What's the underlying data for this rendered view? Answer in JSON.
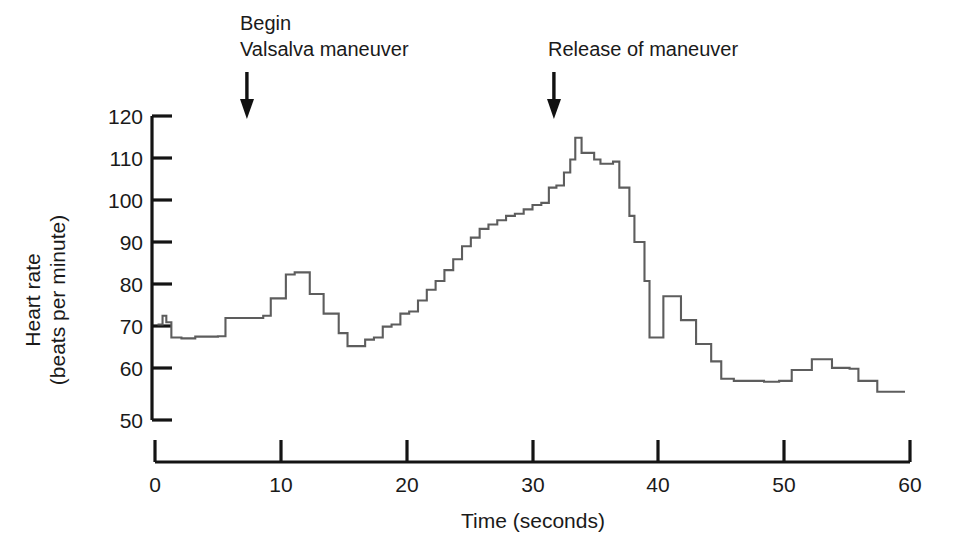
{
  "chart_data": {
    "type": "line",
    "title": "",
    "xlabel": "Time (seconds)",
    "ylabel": "Heart rate\n(beats per minute)",
    "ylabel_line1": "Heart rate",
    "ylabel_line2": "(beats per minute)",
    "xlim": [
      0,
      60
    ],
    "ylim": [
      50,
      120
    ],
    "xticks": [
      0,
      10,
      20,
      30,
      40,
      50,
      60
    ],
    "xtick_labels": [
      "0",
      "10",
      "20",
      "30",
      "40",
      "50",
      "60"
    ],
    "yticks": [
      50,
      60,
      70,
      80,
      90,
      100,
      110,
      120
    ],
    "ytick_labels": [
      "50",
      "60",
      "70",
      "80",
      "90",
      "100",
      "110",
      "120"
    ],
    "grid": false,
    "legend": null,
    "series": [
      {
        "name": "Heart rate",
        "color": "#5d5d5d",
        "style": "step",
        "x": [
          0.2,
          0.6,
          0.9,
          1.3,
          1.7,
          2.1,
          2.6,
          3.2,
          4.2,
          5.0,
          5.6,
          6.3,
          7.2,
          8.0,
          8.6,
          9.2,
          9.8,
          10.4,
          11.1,
          11.8,
          12.3,
          12.9,
          13.4,
          14.0,
          14.6,
          15.3,
          16.0,
          16.7,
          17.4,
          18.1,
          18.8,
          19.5,
          20.2,
          20.9,
          21.6,
          22.3,
          23.0,
          23.7,
          24.4,
          25.1,
          25.8,
          26.5,
          27.2,
          27.9,
          28.6,
          29.3,
          30.0,
          30.7,
          31.3,
          31.9,
          32.5,
          33.0,
          33.4,
          33.9,
          34.4,
          34.9,
          35.4,
          35.9,
          36.4,
          36.9,
          37.3,
          37.7,
          38.1,
          38.5,
          38.9,
          39.3,
          39.8,
          40.4,
          41.1,
          41.8,
          42.4,
          43.0,
          43.6,
          44.2,
          45.0,
          46.0,
          47.2,
          48.4,
          49.6,
          50.6,
          51.4,
          52.2,
          53.0,
          53.8,
          54.5,
          55.2,
          55.9,
          56.6,
          57.4,
          58.4,
          59.6
        ],
        "y": [
          72.0,
          74.0,
          72.5,
          69.0,
          69.0,
          68.8,
          68.8,
          69.2,
          69.2,
          69.3,
          73.5,
          73.5,
          73.5,
          73.5,
          74.0,
          78.0,
          78.0,
          83.5,
          84.0,
          84.0,
          79.0,
          79.0,
          74.5,
          74.5,
          70.0,
          67.0,
          67.0,
          68.5,
          69.0,
          71.5,
          72.0,
          74.5,
          75.0,
          77.5,
          80.0,
          82.0,
          84.5,
          87.0,
          90.0,
          92.0,
          94.0,
          95.0,
          96.0,
          97.0,
          97.5,
          98.5,
          99.5,
          100.0,
          103.5,
          104.0,
          107.0,
          110.0,
          115.0,
          111.5,
          111.5,
          110.0,
          109.0,
          109.0,
          109.5,
          103.5,
          103.5,
          97.0,
          91.0,
          91.0,
          82.0,
          69.0,
          69.0,
          78.5,
          78.5,
          73.0,
          73.0,
          67.5,
          67.5,
          63.5,
          59.5,
          59.0,
          59.0,
          58.8,
          59.0,
          61.5,
          61.5,
          64.0,
          64.0,
          62.0,
          62.0,
          61.8,
          59.0,
          59.0,
          56.5,
          56.5,
          56.5
        ]
      }
    ],
    "annotations": [
      {
        "id": "begin-valsalva",
        "line1": "Begin",
        "line2": "Valsalva maneuver",
        "arrow_x_seconds": 7.4,
        "arrow": "down"
      },
      {
        "id": "release-maneuver",
        "line1": "Release of maneuver",
        "line2": "",
        "arrow_x_seconds": 31.8,
        "arrow": "down"
      }
    ],
    "colors": {
      "curve": "#5d5d5d",
      "axis": "#141414",
      "text": "#1a1a1a",
      "background": "#ffffff"
    }
  }
}
